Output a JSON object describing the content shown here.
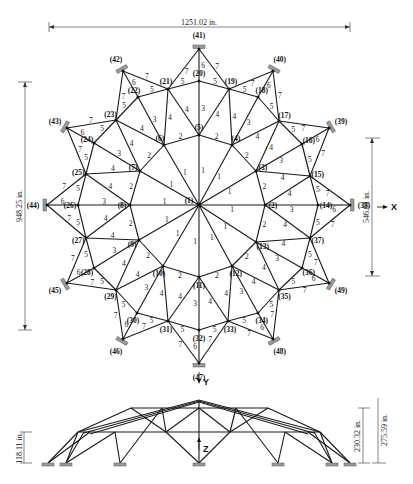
{
  "dimensions": {
    "top_width": "1251.02 in.",
    "left_height": "948.25 in.",
    "right_height": "546.61 in.",
    "elev_small": "118.11 in.",
    "elev_mid": "230.32 in.",
    "elev_total": "275.59 in."
  },
  "axes": {
    "x": "X",
    "y": "Y",
    "z": "Z"
  },
  "nodes": [
    {
      "id": "1",
      "label": "(1)",
      "x": 199,
      "y": 205
    },
    {
      "id": "2",
      "label": "(2)",
      "x": 265,
      "y": 205
    },
    {
      "id": "3",
      "label": "(3)",
      "x": 256,
      "y": 171
    },
    {
      "id": "4",
      "label": "(4)",
      "x": 232,
      "y": 145
    },
    {
      "id": "5",
      "label": "(5)",
      "x": 199,
      "y": 135
    },
    {
      "id": "6",
      "label": "(6)",
      "x": 164,
      "y": 145
    },
    {
      "id": "7",
      "label": "(7)",
      "x": 140,
      "y": 171
    },
    {
      "id": "8",
      "label": "(8)",
      "x": 130,
      "y": 205
    },
    {
      "id": "9",
      "label": "(9)",
      "x": 139,
      "y": 240
    },
    {
      "id": "10",
      "label": "(10)",
      "x": 163,
      "y": 266
    },
    {
      "id": "11",
      "label": "(11)",
      "x": 199,
      "y": 277
    },
    {
      "id": "12",
      "label": "(12)",
      "x": 232,
      "y": 266
    },
    {
      "id": "13",
      "label": "(13)",
      "x": 256,
      "y": 242
    },
    {
      "id": "14",
      "label": "(14)",
      "x": 318,
      "y": 205
    },
    {
      "id": "15",
      "label": "(15)",
      "x": 310,
      "y": 176
    },
    {
      "id": "16",
      "label": "(16)",
      "x": 302,
      "y": 144
    },
    {
      "id": "17",
      "label": "(17)",
      "x": 279,
      "y": 121
    },
    {
      "id": "18",
      "label": "(18)",
      "x": 258,
      "y": 97
    },
    {
      "id": "19",
      "label": "(19)",
      "x": 229,
      "y": 89
    },
    {
      "id": "20",
      "label": "(20)",
      "x": 199,
      "y": 81
    },
    {
      "id": "21",
      "label": "(21)",
      "x": 168,
      "y": 89
    },
    {
      "id": "22",
      "label": "(22)",
      "x": 138,
      "y": 97
    },
    {
      "id": "23",
      "label": "(23)",
      "x": 116,
      "y": 120
    },
    {
      "id": "24",
      "label": "(24)",
      "x": 94,
      "y": 143
    },
    {
      "id": "25",
      "label": "(25)",
      "x": 86,
      "y": 174
    },
    {
      "id": "26",
      "label": "(26)",
      "x": 78,
      "y": 205
    },
    {
      "id": "27",
      "label": "(27)",
      "x": 86,
      "y": 238
    },
    {
      "id": "28",
      "label": "(28)",
      "x": 94,
      "y": 268
    },
    {
      "id": "29",
      "label": "(29)",
      "x": 116,
      "y": 290
    },
    {
      "id": "30",
      "label": "(30)",
      "x": 137,
      "y": 313
    },
    {
      "id": "31",
      "label": "(31)",
      "x": 168,
      "y": 321
    },
    {
      "id": "32",
      "label": "(32)",
      "x": 199,
      "y": 330
    },
    {
      "id": "33",
      "label": "(33)",
      "x": 228,
      "y": 321
    },
    {
      "id": "34",
      "label": "(34)",
      "x": 258,
      "y": 313
    },
    {
      "id": "35",
      "label": "(35)",
      "x": 279,
      "y": 290
    },
    {
      "id": "36",
      "label": "(36)",
      "x": 302,
      "y": 268
    },
    {
      "id": "37",
      "label": "(37)",
      "x": 310,
      "y": 238
    },
    {
      "id": "38",
      "label": "(38)",
      "x": 350,
      "y": 205
    },
    {
      "id": "39",
      "label": "(39)",
      "x": 329,
      "y": 128
    },
    {
      "id": "40",
      "label": "(40)",
      "x": 273,
      "y": 71
    },
    {
      "id": "41",
      "label": "(41)",
      "x": 199,
      "y": 49
    },
    {
      "id": "42",
      "label": "(42)",
      "x": 123,
      "y": 71
    },
    {
      "id": "43",
      "label": "(43)",
      "x": 67,
      "y": 128
    },
    {
      "id": "44",
      "label": "(44)",
      "x": 47,
      "y": 205
    },
    {
      "id": "45",
      "label": "(45)",
      "x": 67,
      "y": 283
    },
    {
      "id": "46",
      "label": "(46)",
      "x": 123,
      "y": 339
    },
    {
      "id": "47",
      "label": "(47)",
      "x": 199,
      "y": 363
    },
    {
      "id": "48",
      "label": "(48)",
      "x": 273,
      "y": 339
    },
    {
      "id": "49",
      "label": "(49)",
      "x": 329,
      "y": 283
    }
  ],
  "members": [
    [
      "1",
      "2",
      1
    ],
    [
      "1",
      "3",
      1
    ],
    [
      "1",
      "4",
      1
    ],
    [
      "1",
      "5",
      1
    ],
    [
      "1",
      "6",
      1
    ],
    [
      "1",
      "7",
      1
    ],
    [
      "1",
      "8",
      1
    ],
    [
      "1",
      "9",
      1
    ],
    [
      "1",
      "10",
      1
    ],
    [
      "1",
      "11",
      1
    ],
    [
      "1",
      "12",
      1
    ],
    [
      "1",
      "13",
      1
    ],
    [
      "2",
      "3",
      2
    ],
    [
      "3",
      "4",
      2
    ],
    [
      "4",
      "5",
      2
    ],
    [
      "5",
      "6",
      2
    ],
    [
      "6",
      "7",
      2
    ],
    [
      "7",
      "8",
      2
    ],
    [
      "8",
      "9",
      2
    ],
    [
      "9",
      "10",
      2
    ],
    [
      "10",
      "11",
      2
    ],
    [
      "11",
      "12",
      2
    ],
    [
      "12",
      "13",
      2
    ],
    [
      "13",
      "2",
      2
    ],
    [
      "2",
      "14",
      3
    ],
    [
      "3",
      "16",
      3
    ],
    [
      "4",
      "18",
      3
    ],
    [
      "5",
      "20",
      3
    ],
    [
      "6",
      "22",
      3
    ],
    [
      "7",
      "24",
      3
    ],
    [
      "8",
      "26",
      3
    ],
    [
      "9",
      "28",
      3
    ],
    [
      "10",
      "30",
      3
    ],
    [
      "11",
      "32",
      3
    ],
    [
      "12",
      "34",
      3
    ],
    [
      "13",
      "36",
      3
    ],
    [
      "2",
      "15",
      4
    ],
    [
      "3",
      "15",
      4
    ],
    [
      "3",
      "17",
      4
    ],
    [
      "4",
      "17",
      4
    ],
    [
      "4",
      "19",
      4
    ],
    [
      "5",
      "19",
      4
    ],
    [
      "5",
      "21",
      4
    ],
    [
      "6",
      "21",
      4
    ],
    [
      "6",
      "23",
      4
    ],
    [
      "7",
      "23",
      4
    ],
    [
      "7",
      "25",
      4
    ],
    [
      "8",
      "25",
      4
    ],
    [
      "8",
      "27",
      4
    ],
    [
      "9",
      "27",
      4
    ],
    [
      "9",
      "29",
      4
    ],
    [
      "10",
      "29",
      4
    ],
    [
      "10",
      "31",
      4
    ],
    [
      "11",
      "31",
      4
    ],
    [
      "11",
      "33",
      4
    ],
    [
      "12",
      "33",
      4
    ],
    [
      "12",
      "35",
      4
    ],
    [
      "13",
      "35",
      4
    ],
    [
      "13",
      "37",
      4
    ],
    [
      "2",
      "37",
      4
    ],
    [
      "14",
      "15",
      5
    ],
    [
      "15",
      "16",
      5
    ],
    [
      "16",
      "17",
      5
    ],
    [
      "17",
      "18",
      5
    ],
    [
      "18",
      "19",
      5
    ],
    [
      "19",
      "20",
      5
    ],
    [
      "20",
      "21",
      5
    ],
    [
      "21",
      "22",
      5
    ],
    [
      "22",
      "23",
      5
    ],
    [
      "23",
      "24",
      5
    ],
    [
      "24",
      "25",
      5
    ],
    [
      "25",
      "26",
      5
    ],
    [
      "26",
      "27",
      5
    ],
    [
      "27",
      "28",
      5
    ],
    [
      "28",
      "29",
      5
    ],
    [
      "29",
      "30",
      5
    ],
    [
      "30",
      "31",
      5
    ],
    [
      "31",
      "32",
      5
    ],
    [
      "32",
      "33",
      5
    ],
    [
      "33",
      "34",
      5
    ],
    [
      "34",
      "35",
      5
    ],
    [
      "35",
      "36",
      5
    ],
    [
      "36",
      "37",
      5
    ],
    [
      "37",
      "14",
      5
    ],
    [
      "14",
      "38",
      6
    ],
    [
      "16",
      "39",
      6
    ],
    [
      "18",
      "40",
      6
    ],
    [
      "20",
      "41",
      6
    ],
    [
      "22",
      "42",
      6
    ],
    [
      "24",
      "43",
      6
    ],
    [
      "26",
      "44",
      6
    ],
    [
      "28",
      "45",
      6
    ],
    [
      "30",
      "46",
      6
    ],
    [
      "32",
      "47",
      6
    ],
    [
      "34",
      "48",
      6
    ],
    [
      "36",
      "49",
      6
    ],
    [
      "15",
      "38",
      7
    ],
    [
      "15",
      "39",
      7
    ],
    [
      "17",
      "39",
      7
    ],
    [
      "17",
      "40",
      7
    ],
    [
      "19",
      "40",
      7
    ],
    [
      "19",
      "41",
      7
    ],
    [
      "21",
      "41",
      7
    ],
    [
      "21",
      "42",
      7
    ],
    [
      "23",
      "42",
      7
    ],
    [
      "23",
      "43",
      7
    ],
    [
      "25",
      "43",
      7
    ],
    [
      "25",
      "44",
      7
    ],
    [
      "27",
      "44",
      7
    ],
    [
      "27",
      "45",
      7
    ],
    [
      "29",
      "45",
      7
    ],
    [
      "29",
      "46",
      7
    ],
    [
      "31",
      "46",
      7
    ],
    [
      "31",
      "47",
      7
    ],
    [
      "33",
      "47",
      7
    ],
    [
      "33",
      "48",
      7
    ],
    [
      "35",
      "48",
      7
    ],
    [
      "35",
      "49",
      7
    ],
    [
      "37",
      "49",
      7
    ],
    [
      "37",
      "38",
      7
    ]
  ],
  "supports": [
    "38",
    "39",
    "40",
    "41",
    "42",
    "43",
    "44",
    "45",
    "46",
    "47",
    "48",
    "49"
  ]
}
